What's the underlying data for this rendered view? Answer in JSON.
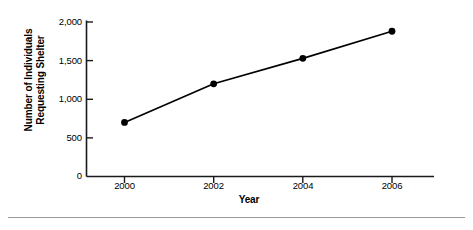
{
  "chart_data": {
    "type": "line",
    "title": "",
    "subtitle": "",
    "xlabel": "Year",
    "ylabel": "Number of Individuals Requesting Shelter",
    "ylabel_lines": [
      "Number of Individuals",
      "Requesting Shelter"
    ],
    "x": [
      2000,
      2002,
      2004,
      2006
    ],
    "categories": [
      "2000",
      "2002",
      "2004",
      "2006"
    ],
    "values": [
      700,
      1200,
      1530,
      1880
    ],
    "series": [
      {
        "name": "Number of Individuals Requesting Shelter",
        "values": [
          700,
          1200,
          1530,
          1880
        ]
      }
    ],
    "xlim": [
      1999,
      2007
    ],
    "ylim": [
      0,
      2000
    ],
    "xticks": [
      2000,
      2002,
      2004,
      2006
    ],
    "xtick_labels": [
      "2000",
      "2002",
      "2004",
      "2006"
    ],
    "yticks": [
      0,
      500,
      1000,
      1500,
      2000
    ],
    "ytick_labels": [
      "0",
      "500",
      "1,000",
      "1,500",
      "2,000"
    ],
    "grid": false,
    "legend": false,
    "legend_position": "none",
    "marker": "filled-circle",
    "line_color": "#000000",
    "marker_color": "#000000",
    "axis_color": "#1a1a1a",
    "background_color": "#ffffff",
    "annotations": []
  },
  "figure": {
    "divider_color": "#9a9a9a"
  }
}
